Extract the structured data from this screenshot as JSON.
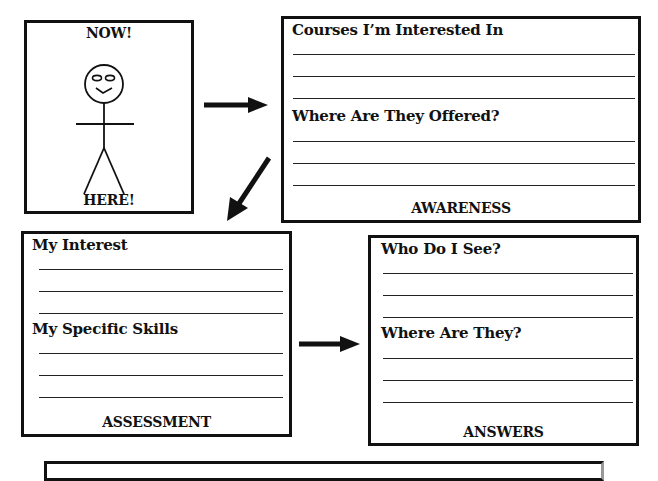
{
  "figure_box": {
    "top_label": "NOW!",
    "bottom_label": "HERE!"
  },
  "awareness_box": {
    "sections": [
      {
        "heading": "Courses I’m Interested In",
        "blank_lines": 3
      },
      {
        "heading": "Where Are They Offered?",
        "blank_lines": 3
      }
    ],
    "caption": "AWARENESS"
  },
  "assessment_box": {
    "sections": [
      {
        "heading": "My Interest",
        "blank_lines": 3
      },
      {
        "heading": "My Specific Skills",
        "blank_lines": 3
      }
    ],
    "caption": "ASSESSMENT"
  },
  "answers_box": {
    "sections": [
      {
        "heading": "Who Do I See?",
        "blank_lines": 3
      },
      {
        "heading": "Where Are They?",
        "blank_lines": 3
      }
    ],
    "caption": "ANSWERS"
  },
  "arrows": [
    {
      "from": "figure_box",
      "to": "awareness_box",
      "direction": "right"
    },
    {
      "from": "awareness_box",
      "to": "assessment_box",
      "direction": "down-left"
    },
    {
      "from": "assessment_box",
      "to": "answers_box",
      "direction": "right"
    }
  ],
  "colors": {
    "ink": "#111111",
    "paper": "#ffffff"
  }
}
